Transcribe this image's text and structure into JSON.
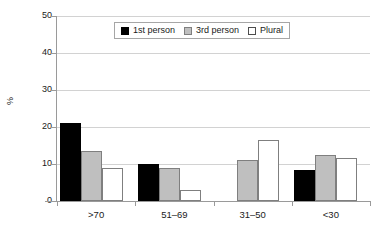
{
  "chart_data": {
    "type": "bar",
    "title": "",
    "xlabel": "",
    "ylabel": "%",
    "ylim": [
      0,
      50
    ],
    "yticks": [
      0,
      10,
      20,
      30,
      40,
      50
    ],
    "grid": true,
    "legend_position": "top-center",
    "categories": [
      ">70",
      "51–69",
      "31–50",
      "<30"
    ],
    "series": [
      {
        "name": "1st person",
        "color": "#000000",
        "values": [
          21,
          10,
          0,
          8.5
        ]
      },
      {
        "name": "3rd person",
        "color": "#bfbfbf",
        "values": [
          13.5,
          9,
          11,
          12.5
        ]
      },
      {
        "name": "Plural",
        "color": "#ffffff",
        "values": [
          9,
          3,
          16.5,
          11.5
        ]
      }
    ]
  }
}
